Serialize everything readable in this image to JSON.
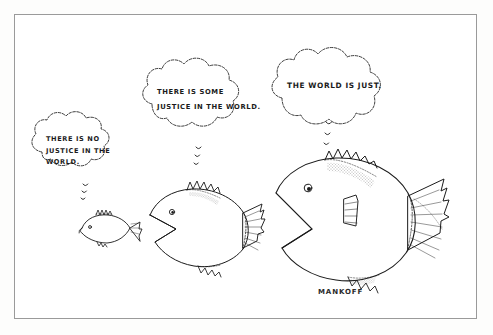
{
  "artwork": {
    "kind": "single-panel-cartoon",
    "medium": "pen-and-ink line drawing",
    "signature": "MANKOFF",
    "ink_color": "#1b1b1b",
    "paper_color": "#ffffff",
    "border_color": "#9a9a9a"
  },
  "thought_bubbles": [
    {
      "id": "bubble-small-fish",
      "owner": "small-fish",
      "lines": [
        "THERE IS NO",
        "JUSTICE IN THE",
        "WORLD."
      ],
      "full_text": "THERE IS NO JUSTICE IN THE WORLD."
    },
    {
      "id": "bubble-medium-fish",
      "owner": "medium-fish",
      "lines": [
        "THERE IS SOME",
        "JUSTICE IN THE WORLD."
      ],
      "full_text": "THERE IS SOME JUSTICE IN THE WORLD."
    },
    {
      "id": "bubble-large-fish",
      "owner": "large-fish",
      "lines": [
        "THE WORLD IS JUST."
      ],
      "full_text": "THE WORLD IS JUST."
    }
  ],
  "fish": [
    {
      "id": "small-fish",
      "size": "small",
      "facing": "left",
      "trail_bubbles": 3
    },
    {
      "id": "medium-fish",
      "size": "medium",
      "facing": "left",
      "trail_bubbles": 3
    },
    {
      "id": "large-fish",
      "size": "large",
      "facing": "left",
      "trail_bubbles": 3
    }
  ]
}
